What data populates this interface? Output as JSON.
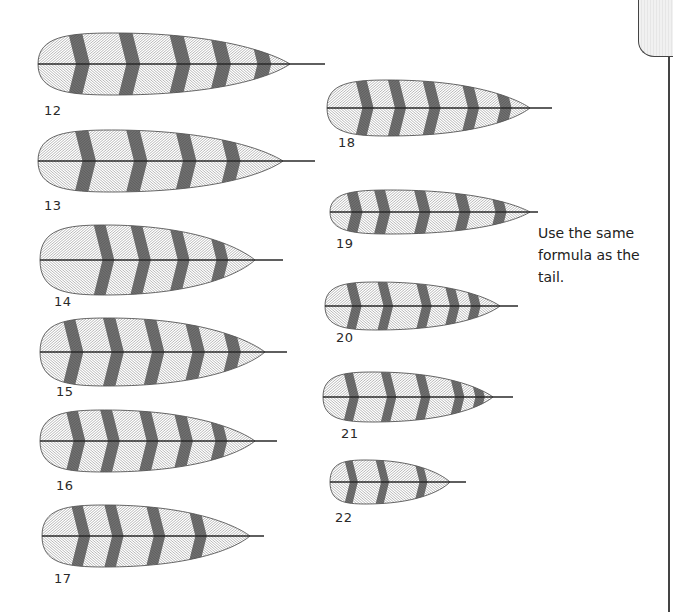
{
  "page": {
    "note": [
      "Use the same",
      "formula as the",
      "tail."
    ],
    "colors": {
      "ink": "#2a2a2a",
      "band": "#3a3a3a",
      "hatch": "#8a8a8a",
      "background": "#ffffff"
    }
  },
  "feathers": [
    {
      "id": "12",
      "label": "12",
      "x": 38,
      "y": 33,
      "w": 252,
      "h": 62,
      "quill": 35,
      "bands": [
        0.12,
        0.32,
        0.52,
        0.68,
        0.84
      ]
    },
    {
      "id": "13",
      "label": "13",
      "x": 38,
      "y": 130,
      "w": 245,
      "h": 62,
      "quill": 32,
      "bands": [
        0.15,
        0.36,
        0.56,
        0.74
      ]
    },
    {
      "id": "14",
      "label": "14",
      "x": 40,
      "y": 225,
      "w": 215,
      "h": 70,
      "quill": 28,
      "bands": [
        0.25,
        0.42,
        0.6,
        0.78
      ]
    },
    {
      "id": "15",
      "label": "15",
      "x": 40,
      "y": 318,
      "w": 225,
      "h": 68,
      "quill": 22,
      "bands": [
        0.1,
        0.28,
        0.46,
        0.64,
        0.8
      ]
    },
    {
      "id": "16",
      "label": "16",
      "x": 40,
      "y": 410,
      "w": 215,
      "h": 62,
      "quill": 22,
      "bands": [
        0.12,
        0.28,
        0.46,
        0.62,
        0.78
      ]
    },
    {
      "id": "17",
      "label": "17",
      "x": 42,
      "y": 505,
      "w": 208,
      "h": 62,
      "quill": 14,
      "bands": [
        0.14,
        0.3,
        0.5,
        0.7
      ]
    },
    {
      "id": "18",
      "label": "18",
      "x": 327,
      "y": 80,
      "w": 203,
      "h": 56,
      "quill": 22,
      "bands": [
        0.14,
        0.3,
        0.47,
        0.66,
        0.82
      ]
    },
    {
      "id": "19",
      "label": "19",
      "x": 330,
      "y": 190,
      "w": 200,
      "h": 44,
      "quill": 8,
      "bands": [
        0.08,
        0.22,
        0.42,
        0.62,
        0.8
      ]
    },
    {
      "id": "20",
      "label": "20",
      "x": 325,
      "y": 282,
      "w": 175,
      "h": 48,
      "quill": 18,
      "bands": [
        0.12,
        0.3,
        0.52,
        0.68,
        0.8
      ]
    },
    {
      "id": "21",
      "label": "21",
      "x": 323,
      "y": 372,
      "w": 170,
      "h": 50,
      "quill": 20,
      "bands": [
        0.12,
        0.34,
        0.54,
        0.74,
        0.86
      ]
    },
    {
      "id": "22",
      "label": "22",
      "x": 330,
      "y": 460,
      "w": 120,
      "h": 44,
      "quill": 16,
      "bands": [
        0.12,
        0.38,
        0.7
      ]
    }
  ],
  "labels": [
    {
      "text": "12",
      "x": 44,
      "y": 103
    },
    {
      "text": "13",
      "x": 44,
      "y": 198
    },
    {
      "text": "14",
      "x": 54,
      "y": 294
    },
    {
      "text": "15",
      "x": 56,
      "y": 384
    },
    {
      "text": "16",
      "x": 56,
      "y": 478
    },
    {
      "text": "17",
      "x": 54,
      "y": 571
    },
    {
      "text": "18",
      "x": 338,
      "y": 135
    },
    {
      "text": "19",
      "x": 336,
      "y": 236
    },
    {
      "text": "20",
      "x": 336,
      "y": 330
    },
    {
      "text": "21",
      "x": 341,
      "y": 426
    },
    {
      "text": "22",
      "x": 335,
      "y": 510
    }
  ]
}
